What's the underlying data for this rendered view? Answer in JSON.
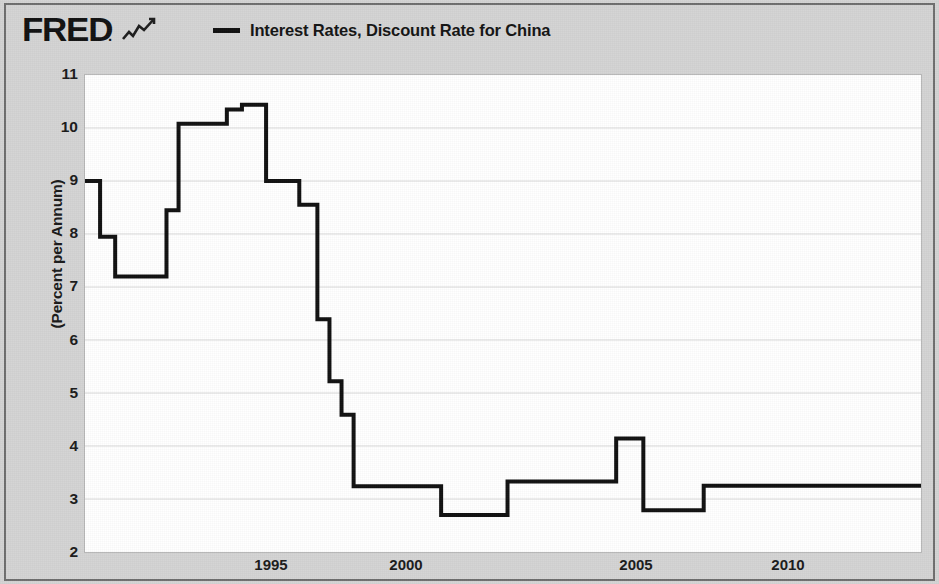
{
  "header": {
    "brand": "FRED",
    "brand_dot": ".",
    "brand_mark_icon": "line-chart-icon",
    "legend_label": "Interest Rates, Discount Rate for China",
    "legend_color": "#111111"
  },
  "axes": {
    "ylabel": "(Percent per Annum)",
    "yticks": [
      "11",
      "10",
      "9",
      "8",
      "7",
      "6",
      "5",
      "4",
      "3",
      "2"
    ],
    "xticks": [
      "1995",
      "2000",
      "2005",
      "2010"
    ]
  },
  "chart_data": {
    "type": "line",
    "title": "Interest Rates, Discount Rate for China",
    "subtitle": "",
    "xlabel": "",
    "ylabel": "(Percent per Annum)",
    "xlim": [
      1990.3,
      2018.0
    ],
    "ylim": [
      2,
      11
    ],
    "yticks": [
      2,
      3,
      4,
      5,
      6,
      7,
      8,
      9,
      10,
      11
    ],
    "xticks": [
      1995,
      2000,
      2005,
      2010
    ],
    "grid": true,
    "grid_axis": "y",
    "legend": "top",
    "line_color": "#111111",
    "line_width": 4,
    "drawstyle": "steps-post",
    "series": [
      {
        "name": "Interest Rates, Discount Rate for China",
        "units": "Percent per Annum",
        "x": [
          1990.3,
          1990.8,
          1991.3,
          1993.0,
          1993.4,
          1995.0,
          1995.5,
          1996.3,
          1997.4,
          1998.0,
          1998.4,
          1998.8,
          1999.2,
          1999.6,
          2002.1,
          2004.3,
          2007.9,
          2008.8,
          2010.8,
          2012.4
        ],
        "y": [
          9.0,
          7.95,
          7.2,
          8.45,
          10.08,
          10.35,
          10.44,
          9.0,
          8.55,
          6.39,
          5.22,
          4.59,
          3.24,
          3.24,
          2.7,
          3.33,
          4.14,
          2.79,
          3.25,
          3.25
        ],
        "points": [
          {
            "x": 1990.3,
            "y": 9.0
          },
          {
            "x": 1990.8,
            "y": 7.95
          },
          {
            "x": 1991.3,
            "y": 7.2
          },
          {
            "x": 1993.0,
            "y": 8.45
          },
          {
            "x": 1993.4,
            "y": 10.08
          },
          {
            "x": 1995.0,
            "y": 10.35
          },
          {
            "x": 1995.5,
            "y": 10.44
          },
          {
            "x": 1996.3,
            "y": 9.0
          },
          {
            "x": 1997.4,
            "y": 8.55
          },
          {
            "x": 1998.0,
            "y": 6.39
          },
          {
            "x": 1998.4,
            "y": 5.22
          },
          {
            "x": 1998.8,
            "y": 4.59
          },
          {
            "x": 1999.2,
            "y": 3.24
          },
          {
            "x": 2002.1,
            "y": 2.7
          },
          {
            "x": 2004.3,
            "y": 3.33
          },
          {
            "x": 2007.9,
            "y": 4.14
          },
          {
            "x": 2008.8,
            "y": 2.79
          },
          {
            "x": 2010.8,
            "y": 3.25
          },
          {
            "x": 2012.4,
            "y": 3.25
          }
        ]
      }
    ]
  }
}
